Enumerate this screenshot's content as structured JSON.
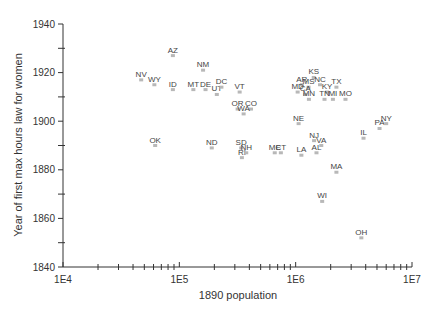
{
  "chart_data": {
    "type": "scatter",
    "title": "",
    "xlabel": "1890 population",
    "ylabel": "Year of first max hours law for women",
    "xscale": "log",
    "xlim": [
      10000,
      10000000
    ],
    "ylim": [
      1840,
      1940
    ],
    "x_tick_labels": [
      "1E4",
      "1E5",
      "1E6",
      "1E7"
    ],
    "y_tick_labels": [
      "1840",
      "1860",
      "1880",
      "1900",
      "1920",
      "1940"
    ],
    "grid": false,
    "legend": null,
    "points": [
      {
        "label": "NV",
        "x": 47000,
        "y": 1917
      },
      {
        "label": "WY",
        "x": 61000,
        "y": 1915
      },
      {
        "label": "AZ",
        "x": 88000,
        "y": 1927
      },
      {
        "label": "ID",
        "x": 88000,
        "y": 1913
      },
      {
        "label": "NM",
        "x": 160000,
        "y": 1921
      },
      {
        "label": "MT",
        "x": 132000,
        "y": 1913
      },
      {
        "label": "DE",
        "x": 168000,
        "y": 1913
      },
      {
        "label": "UT",
        "x": 210000,
        "y": 1911
      },
      {
        "label": "DC",
        "x": 230000,
        "y": 1914
      },
      {
        "label": "VT",
        "x": 330000,
        "y": 1912
      },
      {
        "label": "OR",
        "x": 317000,
        "y": 1905
      },
      {
        "label": "CO",
        "x": 413000,
        "y": 1905
      },
      {
        "label": "WA",
        "x": 357000,
        "y": 1903
      },
      {
        "label": "OK",
        "x": 62000,
        "y": 1890
      },
      {
        "label": "ND",
        "x": 190000,
        "y": 1889
      },
      {
        "label": "SD",
        "x": 340000,
        "y": 1889
      },
      {
        "label": "RI",
        "x": 345000,
        "y": 1885
      },
      {
        "label": "NH",
        "x": 376000,
        "y": 1887
      },
      {
        "label": "ME",
        "x": 661000,
        "y": 1887
      },
      {
        "label": "CT",
        "x": 746000,
        "y": 1887
      },
      {
        "label": "KS",
        "x": 1430000,
        "y": 1918
      },
      {
        "label": "AR",
        "x": 1130000,
        "y": 1915
      },
      {
        "label": "MS",
        "x": 1290000,
        "y": 1914
      },
      {
        "label": "NC",
        "x": 1620000,
        "y": 1915
      },
      {
        "label": "MD",
        "x": 1040000,
        "y": 1912
      },
      {
        "label": "CA",
        "x": 1210000,
        "y": 1911
      },
      {
        "label": "MN",
        "x": 1300000,
        "y": 1909
      },
      {
        "label": "KY",
        "x": 1860000,
        "y": 1912
      },
      {
        "label": "TX",
        "x": 2240000,
        "y": 1914
      },
      {
        "label": "TN",
        "x": 1770000,
        "y": 1909
      },
      {
        "label": "MI",
        "x": 2090000,
        "y": 1909
      },
      {
        "label": "MO",
        "x": 2680000,
        "y": 1909
      },
      {
        "label": "NE",
        "x": 1060000,
        "y": 1899
      },
      {
        "label": "NJ",
        "x": 1440000,
        "y": 1892
      },
      {
        "label": "VA",
        "x": 1660000,
        "y": 1890
      },
      {
        "label": "AL",
        "x": 1510000,
        "y": 1887
      },
      {
        "label": "LA",
        "x": 1120000,
        "y": 1886
      },
      {
        "label": "IL",
        "x": 3830000,
        "y": 1893
      },
      {
        "label": "PA",
        "x": 5260000,
        "y": 1897
      },
      {
        "label": "NY",
        "x": 6000000,
        "y": 1899
      },
      {
        "label": "MA",
        "x": 2240000,
        "y": 1879
      },
      {
        "label": "WI",
        "x": 1690000,
        "y": 1867
      },
      {
        "label": "OH",
        "x": 3670000,
        "y": 1852
      }
    ]
  },
  "colors": {
    "axis": "#333333",
    "marker": "#b8b8b8",
    "label": "#444444"
  }
}
